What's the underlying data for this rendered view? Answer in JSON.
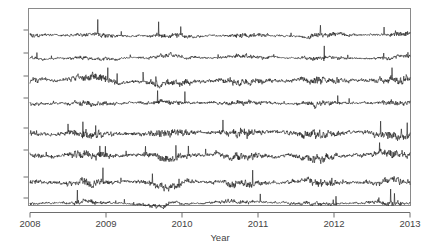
{
  "chart_data": {
    "type": "line",
    "title": "",
    "subtitle": "",
    "xlabel": "Year",
    "ylabel": "",
    "grid": false,
    "legend": null,
    "legend_position": "none",
    "xlim": [
      2008.0,
      2013.0
    ],
    "ylim": [
      0,
      8
    ],
    "x_ticks": [
      "2008",
      "2009",
      "2010",
      "2011",
      "2012",
      "2013"
    ],
    "x_tick_values": [
      2008,
      2009,
      2010,
      2011,
      2012,
      2013
    ],
    "y_ticks": [],
    "y_tick_count": 8,
    "n_series": 8,
    "note": "Eight stacked noisy daily time-series traces sharing a common Year axis; y-axis has 8 unlabeled tick marks, one per trace.",
    "series": [
      {
        "name": "series-1",
        "baseline": 7,
        "amplitude": 1.0,
        "spike_rate": 0.1,
        "seed": 11
      },
      {
        "name": "series-2",
        "baseline": 6,
        "amplitude": 0.78,
        "spike_rate": 0.09,
        "seed": 23
      },
      {
        "name": "series-3",
        "baseline": 5,
        "amplitude": 0.86,
        "spike_rate": 0.08,
        "seed": 37
      },
      {
        "name": "series-4",
        "baseline": 4,
        "amplitude": 0.8,
        "spike_rate": 0.08,
        "seed": 41
      },
      {
        "name": "series-5",
        "baseline": 3,
        "amplitude": 0.84,
        "spike_rate": 0.09,
        "seed": 59
      },
      {
        "name": "series-6",
        "baseline": 2,
        "amplitude": 0.8,
        "spike_rate": 0.08,
        "seed": 67
      },
      {
        "name": "series-7",
        "baseline": 1,
        "amplitude": 0.92,
        "spike_rate": 0.11,
        "seed": 83
      },
      {
        "name": "series-8",
        "baseline": 0,
        "amplitude": 0.9,
        "spike_rate": 0.1,
        "seed": 97
      }
    ],
    "colors": {
      "line": "#1a1a1a",
      "frame": "#8a8a8a",
      "axis": "#6e6e6e",
      "text": "#444444",
      "background": "#ffffff"
    }
  }
}
